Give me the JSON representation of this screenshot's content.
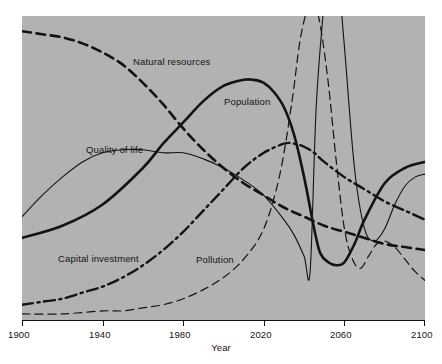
{
  "chart_data": {
    "type": "line",
    "title": "",
    "xlabel": "Year",
    "ylabel": "",
    "xlim": [
      1900,
      2100
    ],
    "ylim": [
      0,
      100
    ],
    "grid": false,
    "legend_position": "inline-annotations",
    "background_color": "#b2b2b2",
    "line_color": "#131313",
    "x_tick_labels": [
      "1900",
      "1940",
      "1980",
      "2020",
      "2060",
      "2100"
    ],
    "x_ticks": [
      1900,
      1940,
      1980,
      2020,
      2060,
      2100
    ],
    "series": [
      {
        "name": "Natural resources",
        "style": "thick-dashed",
        "label": "Natural resources",
        "x": [
          1900,
          1910,
          1920,
          1930,
          1940,
          1950,
          1960,
          1970,
          1980,
          1990,
          2000,
          2010,
          2020,
          2030,
          2040,
          2050,
          2060,
          2070,
          2080,
          2090,
          2100
        ],
        "values": [
          95,
          94,
          93,
          91,
          88,
          84,
          78,
          71,
          63,
          56,
          50,
          45,
          41,
          37,
          34,
          31,
          29,
          27,
          25,
          24,
          23
        ]
      },
      {
        "name": "Population",
        "style": "thick-solid",
        "label": "Population",
        "x": [
          1900,
          1920,
          1940,
          1960,
          1970,
          1980,
          1990,
          2000,
          2010,
          2015,
          2020,
          2025,
          2030,
          2035,
          2040,
          2045,
          2048,
          2052,
          2056,
          2060,
          2065,
          2070,
          2080,
          2090,
          2100
        ],
        "values": [
          27,
          31,
          38,
          50,
          58,
          65,
          72,
          77,
          79,
          79,
          78,
          75,
          70,
          61,
          47,
          30,
          22,
          19,
          18,
          19,
          25,
          33,
          45,
          50,
          52
        ]
      },
      {
        "name": "Quality of life",
        "style": "thin-solid",
        "label": "Quality of life",
        "x": [
          1900,
          1910,
          1920,
          1930,
          1940,
          1950,
          1960,
          1970,
          1980,
          1990,
          2000,
          2010,
          2020,
          2030,
          2035,
          2040,
          2043,
          2046,
          2050,
          2053,
          2056,
          2060,
          2065,
          2070,
          2075,
          2080,
          2085,
          2090,
          2095,
          2100
        ],
        "values": [
          34,
          41,
          47,
          52,
          55,
          56,
          56,
          55,
          55,
          53,
          50,
          46,
          41,
          33,
          28,
          21,
          16,
          70,
          105,
          125,
          120,
          90,
          50,
          30,
          26,
          30,
          38,
          44,
          47,
          48
        ]
      },
      {
        "name": "Capital investment",
        "style": "thick-dash-dot",
        "label": "Capital investment",
        "x": [
          1900,
          1910,
          1920,
          1930,
          1940,
          1950,
          1960,
          1970,
          1980,
          1990,
          2000,
          2010,
          2020,
          2030,
          2035,
          2040,
          2045,
          2050,
          2060,
          2070,
          2080,
          2090,
          2100
        ],
        "values": [
          5,
          6,
          7,
          9,
          11,
          14,
          18,
          23,
          29,
          36,
          43,
          50,
          55,
          58,
          58,
          57,
          55,
          52,
          47,
          43,
          39,
          36,
          33
        ]
      },
      {
        "name": "Pollution",
        "style": "thin-dashed",
        "label": "Pollution",
        "x": [
          1900,
          1920,
          1940,
          1950,
          1960,
          1970,
          1980,
          1990,
          2000,
          2010,
          2020,
          2028,
          2034,
          2038,
          2042,
          2045,
          2048,
          2052,
          2056,
          2060,
          2064,
          2068,
          2072,
          2076,
          2080,
          2085,
          2090,
          2095,
          2100
        ],
        "values": [
          2,
          2,
          3,
          3,
          4,
          5,
          7,
          10,
          14,
          20,
          30,
          48,
          72,
          92,
          103,
          104,
          97,
          78,
          52,
          30,
          20,
          17,
          21,
          25,
          26,
          24,
          20,
          16,
          13
        ]
      }
    ]
  },
  "axis": {
    "title": "Year",
    "tick_1": "1900",
    "tick_2": "1940",
    "tick_3": "1980",
    "tick_4": "2020",
    "tick_5": "2060",
    "tick_6": "2100"
  },
  "annotations": {
    "natural_resources": "Natural resources",
    "population": "Population",
    "quality_of_life": "Quality of life",
    "capital_investment": "Capital investment",
    "pollution": "Pollution"
  }
}
